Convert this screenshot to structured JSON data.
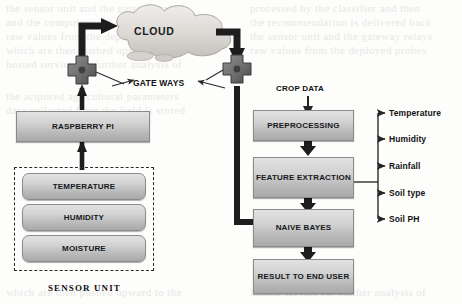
{
  "diagram": {
    "cloud": {
      "label": "CLOUD"
    },
    "gateways": {
      "label": "GATE WAYS"
    },
    "edge": {
      "controller": "RASPBERRY PI",
      "unit_label": "SENSOR UNIT",
      "sensors": [
        {
          "label": "TEMPERATURE"
        },
        {
          "label": "HUMIDITY"
        },
        {
          "label": "MOISTURE"
        }
      ]
    },
    "pipeline": {
      "input_label": "CROP DATA",
      "stages": [
        {
          "label": "PREPROCESSING"
        },
        {
          "label": "FEATURE EXTRACTION"
        },
        {
          "label": "NAIVE BAYES"
        },
        {
          "label": "RESULT TO END USER"
        }
      ]
    },
    "features": [
      {
        "label": "Temperature"
      },
      {
        "label": "Humidity"
      },
      {
        "label": "Rainfall"
      },
      {
        "label": "Soil type"
      },
      {
        "label": "Soil PH"
      }
    ],
    "colors": {
      "box_fill_top": "#e2e2e2",
      "box_fill_bottom": "#a9a9a9",
      "box_border": "#8a8a8a",
      "connector_dark": "#1d1d1d",
      "connector_thin": "#333333",
      "cloud_fill": "#dddad6",
      "page_background": "#fdfdfc"
    }
  },
  "background_text": {
    "lines": [
      "the sensor unit and the gateway relays",
      "and the computational node receives",
      "raw values from the deployed probes",
      "which are then pushed upward to the",
      "hosted service for further analysis of",
      "the acquired agricultural parameters",
      "data collected from the field is stored",
      "processed by the classifier and then",
      "the recommendation is delivered back"
    ]
  }
}
